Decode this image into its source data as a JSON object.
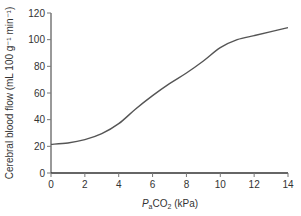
{
  "chart_data": {
    "type": "line",
    "title": "",
    "xlabel": "PaCO2 (kPa)",
    "xlabel_parts": {
      "italic": "P",
      "sub_a": "a",
      "main": "CO",
      "sub_2": "2",
      "unit": " (kPa)"
    },
    "ylabel": "Cerebral blood flow (mL 100 g⁻¹ min⁻¹)",
    "xlim": [
      0,
      14
    ],
    "ylim": [
      0,
      120
    ],
    "x_ticks": [
      0,
      2,
      4,
      6,
      8,
      10,
      12,
      14
    ],
    "y_ticks": [
      0,
      20,
      40,
      60,
      80,
      100,
      120
    ],
    "grid": false,
    "legend": null,
    "series": [
      {
        "name": "Cerebral blood flow",
        "color": "#555555",
        "x": [
          0,
          1,
          2,
          3,
          4,
          5,
          6,
          7,
          8,
          9,
          10,
          11,
          12,
          13,
          14
        ],
        "y": [
          21.5,
          22.5,
          25,
          29.5,
          37,
          48,
          58,
          67,
          75,
          84,
          94,
          100,
          103,
          106,
          109
        ]
      }
    ]
  }
}
